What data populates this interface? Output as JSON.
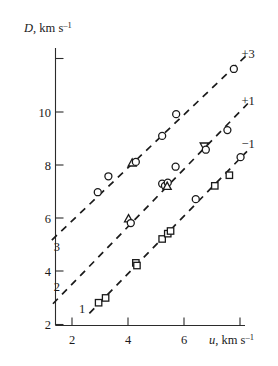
{
  "chart_data": {
    "type": "scatter",
    "title": "",
    "xlabel": "u, km s⁻¹",
    "ylabel": "D, km s⁻¹",
    "xlim": [
      1.0,
      8.6
    ],
    "ylim": [
      2.0,
      12.3
    ],
    "xticks": [
      2,
      4,
      6
    ],
    "yticks": [
      2,
      4,
      6,
      8,
      10,
      12
    ],
    "ytick_labels": [
      "2",
      "4",
      "6",
      "8",
      "10",
      ""
    ],
    "xtick_labels": [
      "2",
      "4",
      "6"
    ],
    "grid": false,
    "legend": "none",
    "annotations": [
      {
        "text": "+3",
        "x": 8.05,
        "y": 12.05,
        "name": "annotation-plus-3"
      },
      {
        "text": "+1",
        "x": 8.05,
        "y": 10.25,
        "name": "annotation-plus-1"
      },
      {
        "text": "−1",
        "x": 8.05,
        "y": 8.65,
        "name": "annotation-minus-1"
      },
      {
        "text": "3",
        "x": 1.35,
        "y": 4.75,
        "name": "curve-label-3"
      },
      {
        "text": "2",
        "x": 1.35,
        "y": 3.25,
        "name": "curve-label-2"
      },
      {
        "text": "1",
        "x": 2.25,
        "y": 2.45,
        "name": "curve-label-1"
      }
    ],
    "series": [
      {
        "name": "3",
        "label": "+3",
        "marker": "circle",
        "points": [
          {
            "x": 2.92,
            "y": 6.98,
            "marker": "circle"
          },
          {
            "x": 3.3,
            "y": 7.58,
            "marker": "circle"
          },
          {
            "x": 4.15,
            "y": 8.08,
            "marker": "triangle-up"
          },
          {
            "x": 4.28,
            "y": 8.12,
            "marker": "circle"
          },
          {
            "x": 5.22,
            "y": 9.1,
            "marker": "circle"
          },
          {
            "x": 5.72,
            "y": 9.92,
            "marker": "circle"
          },
          {
            "x": 7.78,
            "y": 11.62,
            "marker": "circle"
          }
        ],
        "fit": {
          "x0": 1.28,
          "y0": 5.18,
          "x1": 8.22,
          "y1": 12.12
        }
      },
      {
        "name": "2",
        "label": "+1",
        "marker": "circle",
        "points": [
          {
            "x": 4.02,
            "y": 5.98,
            "marker": "triangle-up"
          },
          {
            "x": 4.1,
            "y": 5.82,
            "marker": "circle"
          },
          {
            "x": 5.22,
            "y": 7.3,
            "marker": "circle"
          },
          {
            "x": 5.32,
            "y": 7.22,
            "marker": "circle"
          },
          {
            "x": 5.42,
            "y": 7.34,
            "marker": "circle"
          },
          {
            "x": 5.4,
            "y": 7.2,
            "marker": "triangle-up"
          },
          {
            "x": 5.7,
            "y": 7.94,
            "marker": "circle"
          },
          {
            "x": 6.72,
            "y": 8.72,
            "marker": "triangle-down"
          },
          {
            "x": 6.78,
            "y": 8.58,
            "marker": "circle"
          },
          {
            "x": 7.55,
            "y": 9.32,
            "marker": "circle"
          }
        ],
        "fit": {
          "x0": 1.32,
          "y0": 2.78,
          "x1": 8.28,
          "y1": 10.32
        }
      },
      {
        "name": "1",
        "label": "−1",
        "marker": "square",
        "points": [
          {
            "x": 2.95,
            "y": 2.82,
            "marker": "square"
          },
          {
            "x": 3.2,
            "y": 3.0,
            "marker": "square"
          },
          {
            "x": 4.28,
            "y": 4.32,
            "marker": "square"
          },
          {
            "x": 4.32,
            "y": 4.22,
            "marker": "square"
          },
          {
            "x": 5.22,
            "y": 5.22,
            "marker": "square"
          },
          {
            "x": 5.42,
            "y": 5.42,
            "marker": "square"
          },
          {
            "x": 5.52,
            "y": 5.52,
            "marker": "square"
          },
          {
            "x": 6.42,
            "y": 6.72,
            "marker": "circle"
          },
          {
            "x": 7.1,
            "y": 7.22,
            "marker": "square"
          },
          {
            "x": 7.62,
            "y": 7.62,
            "marker": "square"
          },
          {
            "x": 8.02,
            "y": 8.3,
            "marker": "circle"
          }
        ],
        "fit": {
          "x0": 2.62,
          "y0": 2.42,
          "x1": 8.25,
          "y1": 8.52
        }
      }
    ]
  }
}
